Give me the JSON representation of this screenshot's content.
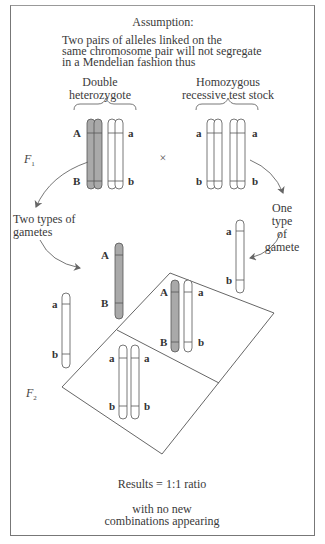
{
  "title": "Assumption:",
  "description": "Two pairs of alleles linked on the\nsame chromosome pair will not segregate\nin a Mendelian fashion thus",
  "parents": {
    "left": {
      "label": "Double\nheterozygote",
      "top_alleles": [
        "A",
        "a"
      ],
      "bottom_alleles": [
        "B",
        "b"
      ]
    },
    "right": {
      "label": "Homozygous\nrecessive test stock",
      "top_alleles": [
        "a",
        "a"
      ],
      "bottom_alleles": [
        "b",
        "b"
      ]
    }
  },
  "cross_symbol": "×",
  "generations": {
    "f1": "F",
    "f1_sub": "1",
    "f2": "F",
    "f2_sub": "2"
  },
  "gametes": {
    "left_label": "Two types of\ngametes",
    "right_label": "One type\nof gamete",
    "left_types": [
      {
        "top": "A",
        "bottom": "B",
        "shaded": true
      },
      {
        "top": "a",
        "bottom": "b",
        "shaded": false
      }
    ],
    "right_type": {
      "top": "a",
      "bottom": "b",
      "shaded": false
    }
  },
  "offspring": [
    {
      "alleles_left": [
        "A",
        "B"
      ],
      "alleles_right": [
        "a",
        "b"
      ]
    },
    {
      "alleles_left": [
        "a",
        "b"
      ],
      "alleles_right": [
        "a",
        "b"
      ]
    }
  ],
  "results": "Results = 1:1 ratio",
  "note": "with no new\ncombinations appearing",
  "colors": {
    "shaded_chromosome": "#a9a9a9",
    "outline": "#555555",
    "arrow": "#666666"
  }
}
